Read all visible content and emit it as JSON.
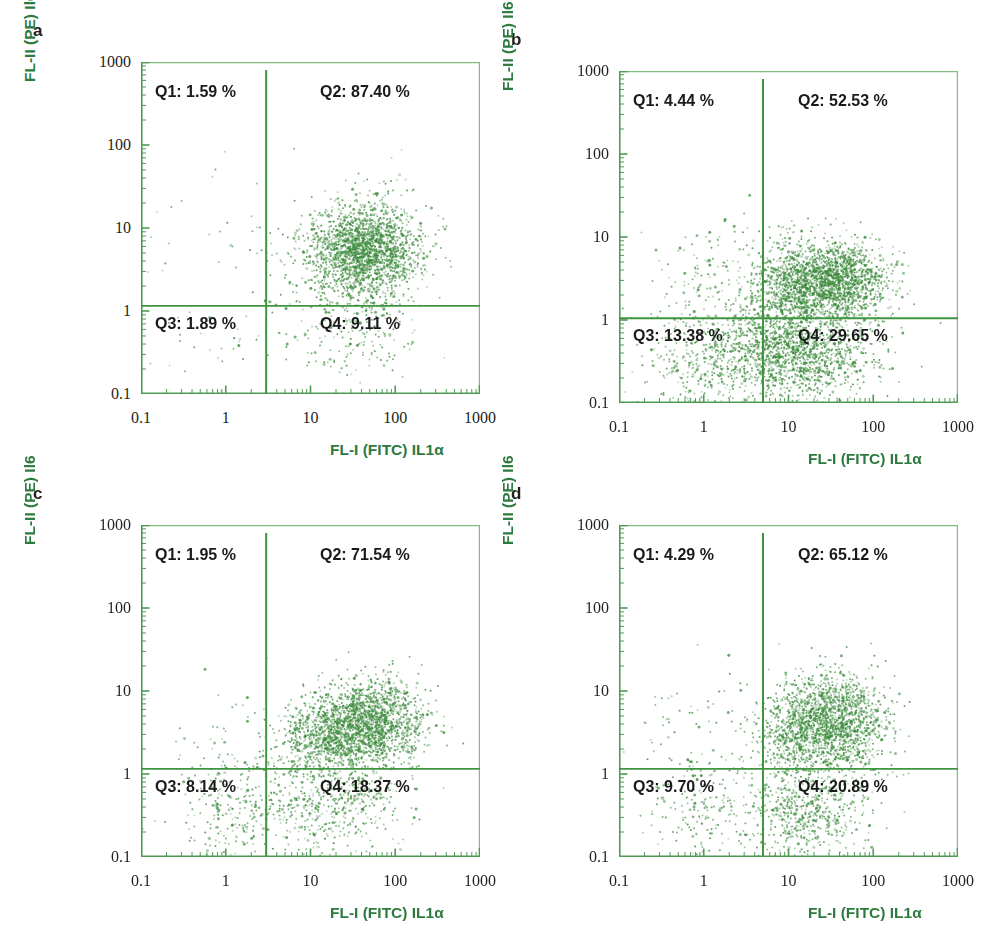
{
  "figure": {
    "width": 983,
    "height": 946,
    "background": "#ffffff",
    "accent_green": "#2d7a3e",
    "frame_green": "#7fba7f",
    "gate_green": "#3f943f",
    "dot_green": "#3d8b3d",
    "text_black": "#231f20"
  },
  "axes": {
    "x_title": "FL-I (FITC) IL1α",
    "y_title": "FL-II (PE) Il6",
    "x_ticks": [
      "0.1",
      "1",
      "10",
      "100",
      "1000"
    ],
    "y_ticks": [
      "1000",
      "100",
      "10",
      "1",
      "0.1"
    ],
    "x_range": [
      0.1,
      1000
    ],
    "y_range": [
      0.1,
      1000
    ],
    "scale": "log"
  },
  "chart_data": {
    "type": "scatter",
    "title": "",
    "xlabel": "FL-I (FITC) IL1α",
    "ylabel": "FL-II (PE) Il6",
    "xlim": [
      0.1,
      1000
    ],
    "ylim": [
      0.1,
      1000
    ],
    "xscale": "log",
    "yscale": "log",
    "grid": false,
    "legend": "none",
    "panels": [
      {
        "letter": "a",
        "quadrants": {
          "Q1": "Q1: 1.59 %",
          "Q2": "Q2: 87.40 %",
          "Q3": "Q3: 1.89 %",
          "Q4": "Q4: 9.11 %"
        },
        "quadrant_values": {
          "Q1": 1.59,
          "Q2": 87.4,
          "Q3": 1.89,
          "Q4": 9.11
        },
        "gate_x": 3.0,
        "gate_y": 1.15,
        "clusters": [
          {
            "quad": "Q2",
            "cx": 45,
            "cy": 5.2,
            "sx": 0.3,
            "sy": 0.26,
            "n": 1500
          },
          {
            "quad": "Q2",
            "cx": 22,
            "cy": 4.4,
            "sx": 0.36,
            "sy": 0.34,
            "n": 430
          },
          {
            "quad": "Q2",
            "cx": 70,
            "cy": 8.0,
            "sx": 0.3,
            "sy": 0.36,
            "n": 190
          },
          {
            "quad": "Q4",
            "cx": 30,
            "cy": 0.55,
            "sx": 0.4,
            "sy": 0.3,
            "n": 210
          },
          {
            "quad": "Q3",
            "cx": 0.7,
            "cy": 0.45,
            "sx": 0.45,
            "sy": 0.38,
            "n": 36
          },
          {
            "quad": "Q1",
            "cx": 0.8,
            "cy": 9.0,
            "sx": 0.45,
            "sy": 0.45,
            "n": 24
          }
        ]
      },
      {
        "letter": "b",
        "quadrants": {
          "Q1": "Q1: 4.44 %",
          "Q2": "Q2: 52.53 %",
          "Q3": "Q3: 13.38 %",
          "Q4": "Q4: 29.65 %"
        },
        "quadrant_values": {
          "Q1": 4.44,
          "Q2": 52.53,
          "Q3": 13.38,
          "Q4": 29.65
        },
        "gate_x": 5.0,
        "gate_y": 1.05,
        "clusters": [
          {
            "quad": "Q2",
            "cx": 26,
            "cy": 2.9,
            "sx": 0.32,
            "sy": 0.24,
            "n": 1450
          },
          {
            "quad": "Q2",
            "cx": 9,
            "cy": 2.4,
            "sx": 0.22,
            "sy": 0.28,
            "n": 420
          },
          {
            "quad": "Q2",
            "cx": 55,
            "cy": 3.2,
            "sx": 0.26,
            "sy": 0.26,
            "n": 300
          },
          {
            "quad": "Q4",
            "cx": 18,
            "cy": 0.38,
            "sx": 0.4,
            "sy": 0.3,
            "n": 950
          },
          {
            "quad": "Q4",
            "cx": 8,
            "cy": 0.55,
            "sx": 0.25,
            "sy": 0.26,
            "n": 330
          },
          {
            "quad": "Q3",
            "cx": 1.4,
            "cy": 0.32,
            "sx": 0.42,
            "sy": 0.3,
            "n": 430
          },
          {
            "quad": "Q3",
            "cx": 2.8,
            "cy": 0.55,
            "sx": 0.28,
            "sy": 0.3,
            "n": 180
          },
          {
            "quad": "Q1",
            "cx": 1.8,
            "cy": 3.0,
            "sx": 0.45,
            "sy": 0.38,
            "n": 150
          }
        ]
      },
      {
        "letter": "c",
        "quadrants": {
          "Q1": "Q1: 1.95 %",
          "Q2": "Q2: 71.54 %",
          "Q3": "Q3: 8.14 %",
          "Q4": "Q4: 18.37 %"
        },
        "quadrant_values": {
          "Q1": 1.95,
          "Q2": 71.54,
          "Q3": 8.14,
          "Q4": 18.37
        },
        "gate_x": 3.0,
        "gate_y": 1.15,
        "clusters": [
          {
            "quad": "Q2",
            "cx": 40,
            "cy": 4.0,
            "sx": 0.34,
            "sy": 0.24,
            "n": 1500
          },
          {
            "quad": "Q2",
            "cx": 14,
            "cy": 2.6,
            "sx": 0.26,
            "sy": 0.22,
            "n": 470
          },
          {
            "quad": "Q2",
            "cx": 75,
            "cy": 5.0,
            "sx": 0.26,
            "sy": 0.28,
            "n": 260
          },
          {
            "quad": "Q4",
            "cx": 20,
            "cy": 0.45,
            "sx": 0.42,
            "sy": 0.32,
            "n": 560
          },
          {
            "quad": "Q3",
            "cx": 1.2,
            "cy": 0.4,
            "sx": 0.42,
            "sy": 0.34,
            "n": 250
          },
          {
            "quad": "Q1",
            "cx": 1.0,
            "cy": 3.0,
            "sx": 0.45,
            "sy": 0.45,
            "n": 34
          }
        ]
      },
      {
        "letter": "d",
        "quadrants": {
          "Q1": "Q1: 4.29 %",
          "Q2": "Q2: 65.12 %",
          "Q3": "Q3: 9.70 %",
          "Q4": "Q4: 20.89 %"
        },
        "quadrant_values": {
          "Q1": 4.29,
          "Q2": 65.12,
          "Q3": 9.7,
          "Q4": 20.89
        },
        "gate_x": 5.0,
        "gate_y": 1.15,
        "clusters": [
          {
            "quad": "Q2",
            "cx": 30,
            "cy": 4.2,
            "sx": 0.3,
            "sy": 0.26,
            "n": 1250
          },
          {
            "quad": "Q2",
            "cx": 12,
            "cy": 3.2,
            "sx": 0.22,
            "sy": 0.26,
            "n": 420
          },
          {
            "quad": "Q2",
            "cx": 60,
            "cy": 5.5,
            "sx": 0.26,
            "sy": 0.3,
            "n": 220
          },
          {
            "quad": "Q4",
            "cx": 20,
            "cy": 0.5,
            "sx": 0.38,
            "sy": 0.32,
            "n": 430
          },
          {
            "quad": "Q4",
            "cx": 14,
            "cy": 0.28,
            "sx": 0.3,
            "sy": 0.2,
            "n": 180
          },
          {
            "quad": "Q3",
            "cx": 1.3,
            "cy": 0.45,
            "sx": 0.42,
            "sy": 0.36,
            "n": 230
          },
          {
            "quad": "Q1",
            "cx": 1.2,
            "cy": 4.0,
            "sx": 0.45,
            "sy": 0.42,
            "n": 60
          }
        ]
      }
    ]
  },
  "layout": {
    "panels": [
      {
        "letter": "a",
        "plot_left": 141,
        "plot_top": 62,
        "plot_width": 339,
        "plot_height": 332
      },
      {
        "letter": "b",
        "plot_left": 619,
        "plot_top": 71,
        "plot_width": 339,
        "plot_height": 332
      },
      {
        "letter": "c",
        "plot_left": 141,
        "plot_top": 525,
        "plot_width": 339,
        "plot_height": 332
      },
      {
        "letter": "d",
        "plot_left": 619,
        "plot_top": 525,
        "plot_width": 339,
        "plot_height": 332
      }
    ]
  }
}
